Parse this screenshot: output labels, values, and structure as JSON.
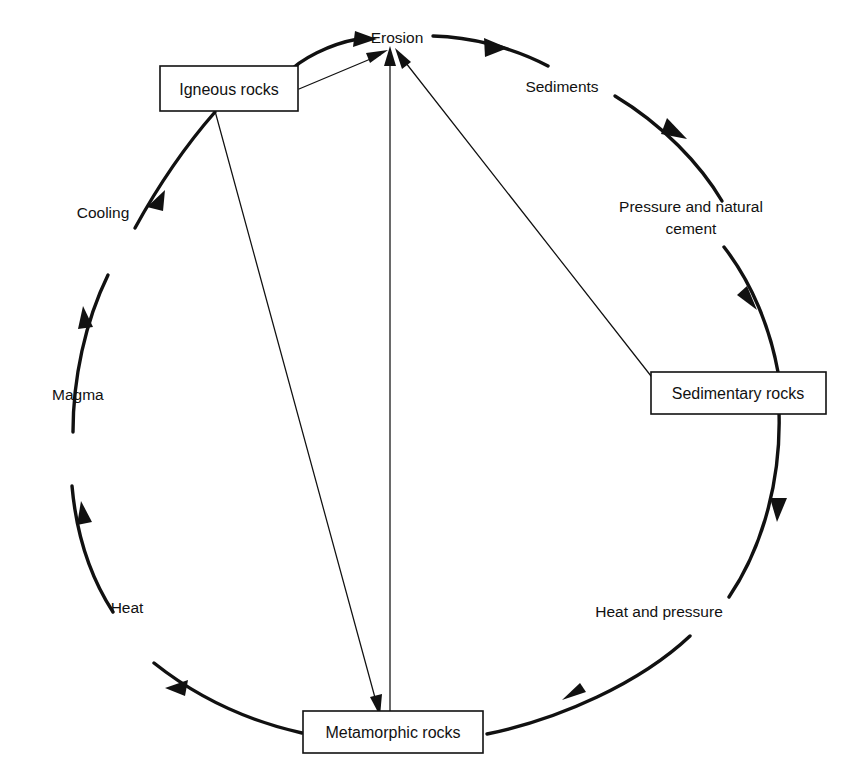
{
  "diagram": {
    "type": "cycle-diagram",
    "nodes": [
      {
        "id": "igneous",
        "label": "Igneous rocks",
        "shape": "box"
      },
      {
        "id": "sedimentary",
        "label": "Sedimentary rocks",
        "shape": "box"
      },
      {
        "id": "metamorphic",
        "label": "Metamorphic rocks",
        "shape": "box"
      }
    ],
    "arc_labels": [
      {
        "id": "erosion",
        "label": "Erosion"
      },
      {
        "id": "sediments",
        "label": "Sediments"
      },
      {
        "id": "pressure",
        "label": "Pressure and natural"
      },
      {
        "id": "pressure2",
        "label": "cement"
      },
      {
        "id": "heatpress",
        "label": "Heat and pressure"
      },
      {
        "id": "heat",
        "label": "Heat"
      },
      {
        "id": "magma",
        "label": "Magma"
      },
      {
        "id": "cooling",
        "label": "Cooling"
      }
    ],
    "colors": {
      "ink": "#111111",
      "paper": "#ffffff"
    }
  }
}
